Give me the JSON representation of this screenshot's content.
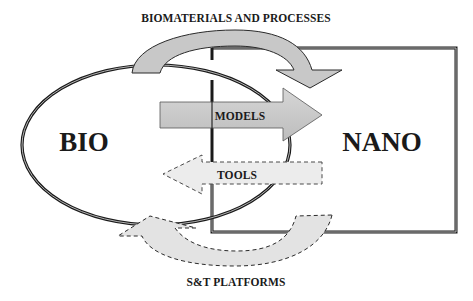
{
  "diagram": {
    "title_top": "BIOMATERIALS AND PROCESSES",
    "title_bottom": "S&T PLATFORMS",
    "nodes": {
      "bio": {
        "label": "BIO",
        "shape": "ellipse"
      },
      "nano": {
        "label": "NANO",
        "shape": "rectangle"
      }
    },
    "arrows": [
      {
        "id": "biomaterials",
        "label": "BIOMATERIALS AND PROCESSES",
        "from": "BIO",
        "to": "NANO",
        "style": "solid",
        "shape": "curved"
      },
      {
        "id": "models",
        "label": "MODELS",
        "from": "BIO",
        "to": "NANO",
        "style": "solid",
        "shape": "straight"
      },
      {
        "id": "tools",
        "label": "TOOLS",
        "from": "NANO",
        "to": "BIO",
        "style": "dashed",
        "shape": "straight"
      },
      {
        "id": "st-platforms",
        "label": "S&T PLATFORMS",
        "from": "NANO",
        "to": "BIO",
        "style": "dashed",
        "shape": "curved"
      }
    ],
    "colors": {
      "solid_arrow_fill": "#c8c8c8",
      "dashed_arrow_fill": "#e6e6e6",
      "outline": "#1a1a1a",
      "background": "#ffffff"
    }
  }
}
